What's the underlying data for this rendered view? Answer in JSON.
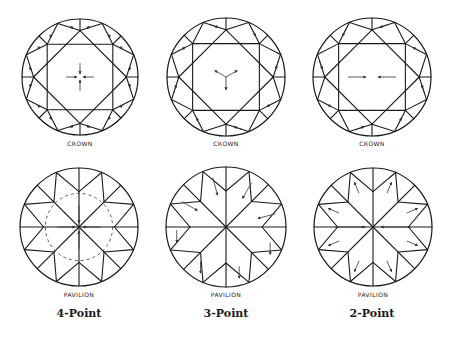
{
  "figure": {
    "stroke_color": "#1a1a1a",
    "arrow_color": "#333333",
    "columns": [
      {
        "title": "4-Point",
        "arrow_pattern": "4-point",
        "crown": {
          "label": "CROWN",
          "cx": 80,
          "cy": 77,
          "r": 58
        },
        "pavilion": {
          "label": "PAVILION",
          "cx": 79,
          "cy": 227,
          "r": 59
        }
      },
      {
        "title": "3-Point",
        "arrow_pattern": "3-point",
        "crown": {
          "label": "CROWN",
          "cx": 226,
          "cy": 77,
          "r": 59
        },
        "pavilion": {
          "label": "PAVILION",
          "cx": 226,
          "cy": 227,
          "r": 60
        }
      },
      {
        "title": "2-Point",
        "arrow_pattern": "2-point",
        "crown": {
          "label": "CROWN",
          "cx": 372,
          "cy": 77,
          "r": 59
        },
        "pavilion": {
          "label": "PAVILION",
          "cx": 373,
          "cy": 227,
          "r": 59
        }
      }
    ]
  }
}
